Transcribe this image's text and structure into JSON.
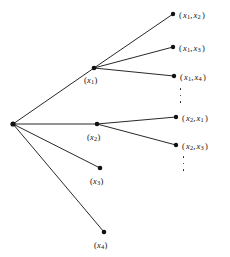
{
  "figure": {
    "type": "tree-diagram",
    "background_color": "#ffffff",
    "ink_color": "#111111",
    "width": 230,
    "height": 257
  },
  "root": {
    "name": "root-node",
    "x": 13,
    "y": 124
  },
  "level1": [
    {
      "id": "x1",
      "label_prefix": "(",
      "label_var": "x",
      "label_sub": "1",
      "label_suffix": ")",
      "label_text": "(x1)",
      "x": 94,
      "y": 68,
      "label_x": 84,
      "label_y": 76
    },
    {
      "id": "x2",
      "label_prefix": "(",
      "label_var": "x",
      "label_sub": "2",
      "label_suffix": ")",
      "label_text": "(x2)",
      "x": 97,
      "y": 124,
      "label_x": 87,
      "label_y": 133
    },
    {
      "id": "x3",
      "label_prefix": "(",
      "label_var": "x",
      "label_sub": "3",
      "label_suffix": ")",
      "label_text": "(x3)",
      "x": 100,
      "y": 168,
      "label_x": 90,
      "label_y": 177
    },
    {
      "id": "x4",
      "label_prefix": "(",
      "label_var": "x",
      "label_sub": "4",
      "label_suffix": ")",
      "label_text": "(x4)",
      "x": 104,
      "y": 232,
      "label_x": 94,
      "label_y": 241
    }
  ],
  "level2": [
    {
      "id": "x1x2",
      "parent": "x1",
      "label_text": "(x1, x2)",
      "sub_a": "1",
      "sub_b": "2",
      "x": 173,
      "y": 14,
      "label_x": 179,
      "label_y": 11
    },
    {
      "id": "x1x3",
      "parent": "x1",
      "label_text": "(x1, x3)",
      "sub_a": "1",
      "sub_b": "3",
      "x": 173,
      "y": 47,
      "label_x": 179,
      "label_y": 44
    },
    {
      "id": "x1x4",
      "parent": "x1",
      "label_text": "(x1, x4)",
      "sub_a": "1",
      "sub_b": "4",
      "x": 174,
      "y": 76,
      "label_x": 180,
      "label_y": 73
    },
    {
      "id": "x2x1",
      "parent": "x2",
      "label_text": "(x2, x1)",
      "sub_a": "2",
      "sub_b": "1",
      "x": 176,
      "y": 117,
      "label_x": 182,
      "label_y": 114
    },
    {
      "id": "x2x3",
      "parent": "x2",
      "label_text": "(x2, x3)",
      "sub_a": "2",
      "sub_b": "3",
      "x": 176,
      "y": 145,
      "label_x": 182,
      "label_y": 142
    }
  ],
  "ellipses": [
    {
      "id": "ellipsis-after-x1x4",
      "x": 179,
      "y": 88,
      "height": 15,
      "dots": 3
    },
    {
      "id": "ellipsis-after-x2x3",
      "x": 182,
      "y": 156,
      "height": 15,
      "dots": 3
    }
  ],
  "edges": [
    {
      "from": "root",
      "to": "x1"
    },
    {
      "from": "root",
      "to": "x2"
    },
    {
      "from": "root",
      "to": "x3"
    },
    {
      "from": "root",
      "to": "x4"
    },
    {
      "from": "x1",
      "to": "x1x2"
    },
    {
      "from": "x1",
      "to": "x1x3"
    },
    {
      "from": "x1",
      "to": "x1x4"
    },
    {
      "from": "x2",
      "to": "x2x1"
    },
    {
      "from": "x2",
      "to": "x2x3"
    }
  ]
}
